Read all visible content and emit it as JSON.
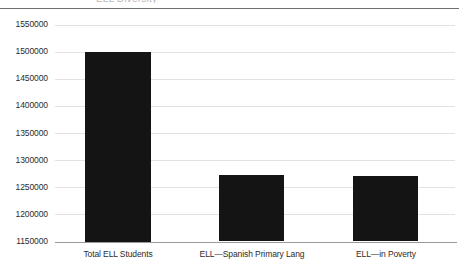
{
  "chart_data": {
    "type": "bar",
    "title": "ELL Diversity",
    "title_clipped": true,
    "categories": [
      "Total ELL Students",
      "ELL—Spanish Primary Lang",
      "ELL—in Poverty"
    ],
    "values": [
      1500000,
      1272000,
      1270000
    ],
    "xlabel": "",
    "ylabel": "",
    "ylim": [
      1150000,
      1550000
    ],
    "ytick_step": 50000,
    "yticks": [
      1550000,
      1500000,
      1450000,
      1400000,
      1350000,
      1300000,
      1250000,
      1200000,
      1150000
    ],
    "ytick_labels": [
      "1550000",
      "1500000",
      "1450000",
      "1400000",
      "1350000",
      "1300000",
      "1250000",
      "1200000",
      "1150000"
    ],
    "grid": true,
    "legend": false,
    "bar_color": "#141414",
    "gridline_color": "#e2e2e2",
    "axis_color": "#9a9a9a",
    "text_color": "#2b2b2b"
  }
}
